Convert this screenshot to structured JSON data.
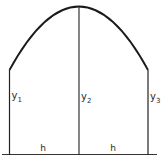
{
  "diagram": {
    "type": "parabolic-arc-over-two-strips",
    "colors": {
      "stroke": "#222222",
      "background": "#ffffff"
    },
    "ordinates": [
      {
        "label": "y",
        "subscript": "1"
      },
      {
        "label": "y",
        "subscript": "2"
      },
      {
        "label": "y",
        "subscript": "3"
      }
    ],
    "intervals": [
      {
        "label": "h"
      },
      {
        "label": "h"
      }
    ]
  }
}
